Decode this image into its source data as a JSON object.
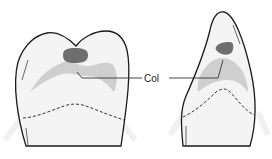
{
  "diagram": {
    "label": "Col",
    "colors": {
      "outline": "#1a1a1a",
      "tooth_fill": "#f4f4f4",
      "col_region": "#cfcfcf",
      "pulp_spot": "#6e6e6e",
      "leader_line": "#333333",
      "cej_dashed": "#333333",
      "bg_glare": "#ececec"
    },
    "teeth": [
      {
        "id": "molar-buccal-view",
        "features": [
          "crown-outline",
          "col-region",
          "dark-spot",
          "cej-dashed-line"
        ]
      },
      {
        "id": "premolar-proximal-view",
        "features": [
          "crown-outline",
          "col-region",
          "dark-spot",
          "cej-dashed-line"
        ]
      }
    ]
  }
}
